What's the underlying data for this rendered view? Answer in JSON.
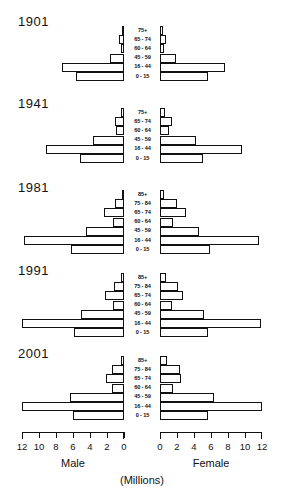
{
  "chart_data": {
    "type": "bar",
    "subtype": "population-pyramid",
    "title": "",
    "xlabel": "(Millions)",
    "ylabel": "",
    "units": "(Millions)",
    "left_side_label": "Male",
    "right_side_label": "Female",
    "xlim": [
      0,
      12
    ],
    "grid": false,
    "legend": "none",
    "left_axis_ticks": [
      "12",
      "10",
      "8",
      "6",
      "4",
      "2",
      "0"
    ],
    "right_axis_ticks": [
      "0",
      "2",
      "4",
      "6",
      "8",
      "10",
      "12"
    ],
    "tick_values": [
      12,
      10,
      8,
      6,
      4,
      2,
      0
    ],
    "panels": [
      {
        "year": "1901",
        "age_groups": [
          "75+",
          "65 - 74",
          "60 - 64",
          "45 - 59",
          "16 - 44",
          "0 - 15"
        ],
        "series": [
          {
            "name": "Male",
            "values": [
              0.2,
              0.6,
              0.4,
              1.7,
              7.3,
              5.6
            ]
          },
          {
            "name": "Female",
            "values": [
              0.3,
              0.7,
              0.5,
              1.9,
              7.6,
              5.6
            ]
          }
        ]
      },
      {
        "year": "1941",
        "age_groups": [
          "75+",
          "65 - 74",
          "60 - 64",
          "45 - 59",
          "16 - 44",
          "0 - 15"
        ],
        "series": [
          {
            "name": "Male",
            "values": [
              0.4,
              1.1,
              0.9,
              3.7,
              9.2,
              5.2
            ]
          },
          {
            "name": "Female",
            "values": [
              0.6,
              1.4,
              1.1,
              4.2,
              9.6,
              5.1
            ]
          }
        ]
      },
      {
        "year": "1981",
        "age_groups": [
          "85+",
          "75 - 84",
          "65 - 74",
          "60 - 64",
          "45 - 59",
          "16 - 44",
          "0 - 15"
        ],
        "series": [
          {
            "name": "Male",
            "values": [
              0.2,
              1.1,
              2.3,
              1.3,
              4.5,
              11.8,
              6.2
            ]
          },
          {
            "name": "Female",
            "values": [
              0.5,
              2.0,
              3.0,
              1.5,
              4.6,
              11.6,
              5.9
            ]
          }
        ]
      },
      {
        "year": "1991",
        "age_groups": [
          "85+",
          "75 - 84",
          "65 - 74",
          "60 - 64",
          "45 - 59",
          "16 - 44",
          "0 - 15"
        ],
        "series": [
          {
            "name": "Male",
            "values": [
              0.3,
              1.2,
              2.2,
              1.3,
              5.1,
              12.2,
              5.9
            ]
          },
          {
            "name": "Female",
            "values": [
              0.7,
              2.1,
              2.7,
              1.4,
              5.2,
              11.9,
              5.6
            ]
          }
        ]
      },
      {
        "year": "2001",
        "age_groups": [
          "85+",
          "75 - 84",
          "65 - 74",
          "60 - 64",
          "45 - 59",
          "16 - 44",
          "0 - 15"
        ],
        "series": [
          {
            "name": "Male",
            "values": [
              0.4,
              1.4,
              2.1,
              1.4,
              6.3,
              12.2,
              6.0
            ]
          },
          {
            "name": "Female",
            "values": [
              0.8,
              2.3,
              2.5,
              1.5,
              6.4,
              12.0,
              5.7
            ]
          }
        ]
      }
    ]
  },
  "colors": {
    "ink": "#111111",
    "background": "#ffffff",
    "bar_fill": "#ffffff",
    "bar_stroke": "#111111"
  }
}
